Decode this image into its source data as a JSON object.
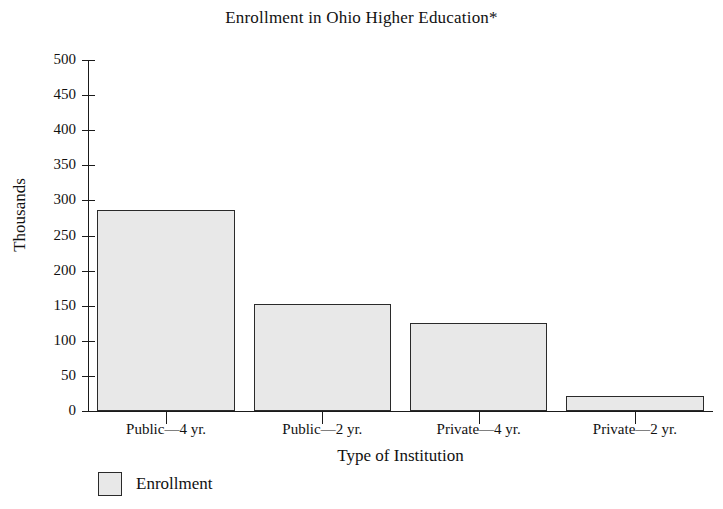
{
  "chart_data": {
    "type": "bar",
    "title": "Enrollment in Ohio Higher Education*",
    "xlabel": "Type of Institution",
    "ylabel": "Thousands",
    "categories": [
      "Public—4 yr.",
      "Public—2 yr.",
      "Private—4 yr.",
      "Private—2 yr."
    ],
    "values": [
      287,
      152,
      125,
      22
    ],
    "ylim": [
      0,
      500
    ],
    "ytick_step": 50,
    "yticks": [
      0,
      50,
      100,
      150,
      200,
      250,
      300,
      350,
      400,
      450,
      500
    ],
    "ytick_labels": [
      "0",
      "50",
      "100",
      "150",
      "200",
      "250",
      "300",
      "350",
      "400",
      "450",
      "500"
    ],
    "grid": false,
    "legend": {
      "position": "bottom-left",
      "entries": [
        {
          "label": "Enrollment",
          "color": "#e8e8e8",
          "border_color": "#2a2a2a"
        }
      ]
    },
    "series": [
      {
        "name": "Enrollment",
        "values": [
          287,
          152,
          125,
          22
        ]
      }
    ],
    "colors": {
      "bar_fill": "#e8e8e8",
      "bar_border": "#2a2a2a",
      "axis": "#1a1a1a",
      "text": "#111111",
      "background": "#ffffff"
    }
  }
}
